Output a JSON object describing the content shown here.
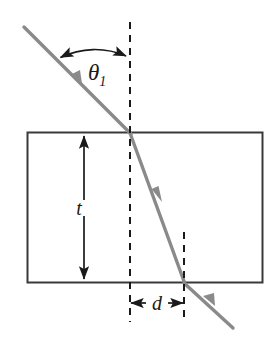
{
  "figure": {
    "background_color": "#ffffff",
    "labels": {
      "incident_angle": "θ",
      "incident_angle_subscript": "1",
      "thickness": "t",
      "lateral_displacement": "d"
    },
    "colors": {
      "ray": "#8a8a8a",
      "slab_outline": "#3a3a3a",
      "normal_dashed": "#1a1a1a",
      "dimension_arrow": "#1a1a1a",
      "angle_arc": "#1a1a1a",
      "label_text": "#1a1a1a"
    },
    "geometry": {
      "slab": {
        "x": 27,
        "y": 132,
        "width": 236,
        "height": 151
      },
      "normal_line_1": {
        "x": 130,
        "y_top": 22,
        "y_bottom": 322
      },
      "normal_line_2": {
        "x": 184,
        "y_top": 232,
        "y_bottom": 322
      },
      "incident_ray": {
        "x1": 24,
        "y1": 27,
        "x2": 130,
        "y2": 133
      },
      "refracted_ray": {
        "x1": 130,
        "y1": 133,
        "x2": 184,
        "y2": 283
      },
      "exit_ray": {
        "x1": 184,
        "y1": 283,
        "x2": 232,
        "y2": 327
      },
      "thickness_arrow": {
        "x": 84,
        "y_top": 134,
        "y_bottom": 281
      },
      "displacement_arrow": {
        "y": 303,
        "x_left": 130,
        "x_right": 184
      },
      "angle_arc": {
        "center_x": 130,
        "center_y": 133,
        "radius": 78
      }
    }
  }
}
